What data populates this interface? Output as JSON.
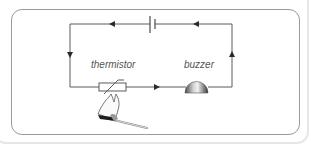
{
  "diagram": {
    "type": "electric circuit",
    "components": [
      {
        "id": "cell",
        "label": "",
        "icon": "battery-cell-icon"
      },
      {
        "id": "thermistor",
        "label": "thermistor",
        "icon": "thermistor-icon"
      },
      {
        "id": "buzzer",
        "label": "buzzer",
        "icon": "buzzer-icon"
      },
      {
        "id": "flame",
        "label": "",
        "icon": "lit-match-icon"
      }
    ],
    "current_direction": "anticlockwise",
    "colors": {
      "wire": "#555555",
      "border": "#9a9a9a",
      "label": "#555555"
    }
  },
  "labels": {
    "thermistor": "thermistor",
    "buzzer": "buzzer"
  }
}
